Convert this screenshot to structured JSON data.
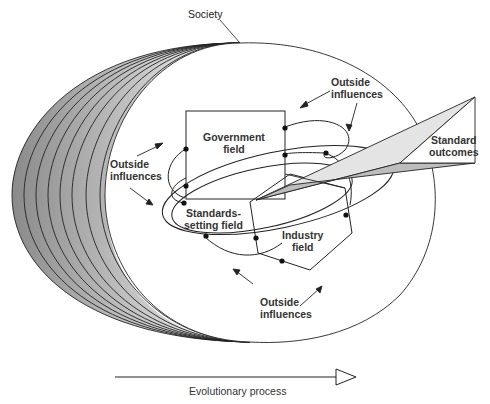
{
  "diagram": {
    "type": "conceptual-model",
    "labels": {
      "society": "Society",
      "government_field": [
        "Government",
        "field"
      ],
      "standards_setting_field": [
        "Standards-",
        "setting field"
      ],
      "industry_field": [
        "Industry",
        "field"
      ],
      "standard_outcomes": [
        "Standard",
        "outcomes"
      ],
      "outside_influences_top": [
        "Outside",
        "influences"
      ],
      "outside_influences_left": [
        "Outside",
        "influences"
      ],
      "outside_influences_bottom": [
        "Outside",
        "influences"
      ],
      "evolutionary_process": "Evolutionary process"
    },
    "colors": {
      "stroke": "#222222",
      "shade_dark": "#8a8a8a",
      "shade_light": "#f2f2f2",
      "wedge_light": "#e4e4e4",
      "wedge_dark": "#bdbdbd"
    },
    "society_layers": 8
  }
}
